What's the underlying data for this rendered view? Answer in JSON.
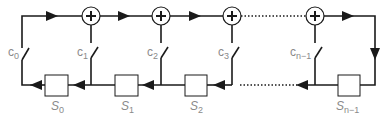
{
  "diagram": {
    "type": "linear-feedback-shift-register",
    "colors": {
      "line": "#1a1a1a",
      "label": "#8a8a8a",
      "box_fill": "#ffffff"
    },
    "coefficients": [
      {
        "base": "c",
        "sub": "0"
      },
      {
        "base": "c",
        "sub": "1"
      },
      {
        "base": "c",
        "sub": "2"
      },
      {
        "base": "c",
        "sub": "3"
      },
      {
        "base": "c",
        "sub": "n−1"
      }
    ],
    "registers": [
      {
        "base": "S",
        "sub": "0"
      },
      {
        "base": "S",
        "sub": "1"
      },
      {
        "base": "S",
        "sub": "2"
      },
      {
        "base": "S",
        "sub": "n−1"
      }
    ],
    "adder_symbol": "+",
    "adder_count": 4
  }
}
